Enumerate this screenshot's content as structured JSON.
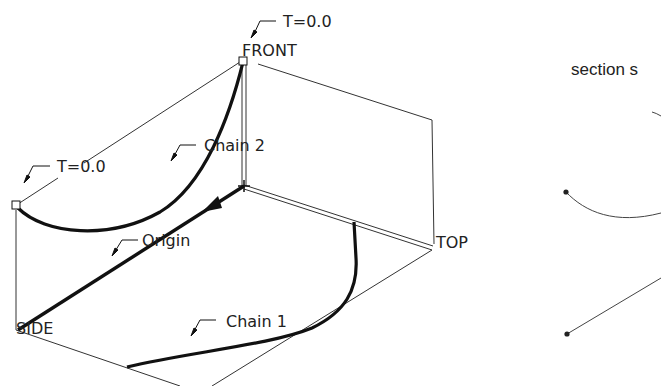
{
  "diagram": {
    "datum_planes": {
      "front": "FRONT",
      "top": "TOP",
      "side": "SIDE"
    },
    "annotations": {
      "t_front": "T=0.0",
      "t_left": "T=0.0",
      "chain2": "Chain 2",
      "chain1": "Chain 1",
      "origin": "Origin"
    },
    "right_panel": {
      "title": "section s"
    },
    "colors": {
      "stroke": "#111111",
      "thin_line": "#333333",
      "background": "#ffffff"
    }
  }
}
